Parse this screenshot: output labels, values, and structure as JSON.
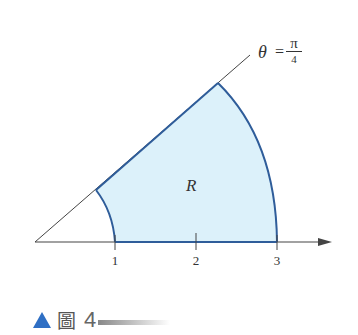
{
  "diagram": {
    "region_label": "R",
    "ray_label": {
      "theta": "θ",
      "equals": "=",
      "numerator": "π",
      "denominator": "4"
    },
    "ticks": [
      {
        "label": "1",
        "x": 115
      },
      {
        "label": "2",
        "x": 196
      },
      {
        "label": "3",
        "x": 277
      }
    ],
    "colors": {
      "fill": "#dcf1fa",
      "boundary": "#2f5d9a",
      "axis": "#444444",
      "accent": "#2f6fc4"
    }
  },
  "caption": {
    "glyph": "圖",
    "number": "4"
  }
}
